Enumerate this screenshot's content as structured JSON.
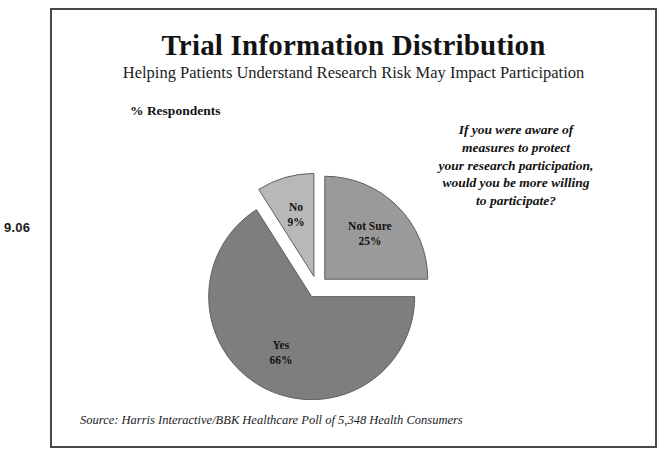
{
  "margin_code": "9.06",
  "slide": {
    "title": "Trial Information Distribution",
    "subtitle": "Helping Patients Understand Research Risk May Impact Participation",
    "axis_caption": "% Respondents",
    "source": "Source: Harris Interactive/BBK Healthcare Poll of 5,348 Health Consumers"
  },
  "question": {
    "line1": "If you were aware of",
    "line2": "measures to protect",
    "line3": "your research participation,",
    "line4": "would you be more willing",
    "line5": "to participate?"
  },
  "chart_data": {
    "type": "pie",
    "title": "Trial Information Distribution",
    "subtitle": "Helping Patients Understand Research Risk May Impact Participation",
    "ylabel": "% Respondents",
    "units": "percent",
    "exploded": true,
    "start_angle_deg": 0,
    "direction": "clockwise",
    "legend": "none-inline-labels",
    "categories": [
      "Not Sure",
      "Yes",
      "No"
    ],
    "values": [
      25,
      66,
      9
    ],
    "colors": [
      "#9a9a9a",
      "#7e7e7e",
      "#b8b8b8"
    ],
    "slices": [
      {
        "name": "Not Sure",
        "value": 25,
        "label": "Not Sure",
        "value_label": "25%",
        "color": "#9a9a9a"
      },
      {
        "name": "Yes",
        "value": 66,
        "label": "Yes",
        "value_label": "66%",
        "color": "#7e7e7e"
      },
      {
        "name": "No",
        "value": 9,
        "label": "No",
        "value_label": "9%",
        "color": "#b8b8b8"
      }
    ],
    "annotations": [
      "Source: Harris Interactive/BBK Healthcare Poll of 5,348 Health Consumers"
    ]
  }
}
